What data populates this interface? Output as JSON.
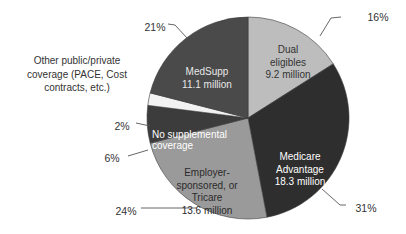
{
  "chart_data": {
    "type": "pie",
    "title": "",
    "start": "top",
    "direction": "clockwise",
    "slices": [
      {
        "key": "dual",
        "label_lines": [
          "Dual",
          "eligibles",
          "9.2 million"
        ],
        "value_millions": 9.2,
        "percent": 16,
        "percent_label": "16%",
        "color": "#bdbdbd",
        "text_color": "#333333"
      },
      {
        "key": "ma",
        "label_lines": [
          "Medicare",
          "Advantage",
          "18.3 million"
        ],
        "value_millions": 18.3,
        "percent": 31,
        "percent_label": "31%",
        "color": "#2e2e2e",
        "text_color": "#ffffff"
      },
      {
        "key": "employer",
        "label_lines": [
          "Employer-",
          "sponsored, or",
          "Tricare",
          "13.6 million"
        ],
        "value_millions": 13.6,
        "percent": 24,
        "percent_label": "24%",
        "color": "#9a9a9a",
        "text_color": "#2a2a2a"
      },
      {
        "key": "nosupp",
        "label_lines": [
          "No supplemental",
          "coverage"
        ],
        "value_millions": null,
        "percent": 6,
        "percent_label": "6%",
        "color": "#3c3c3c",
        "text_color": "#ffffff"
      },
      {
        "key": "other",
        "label_lines": [
          "Other public/private",
          "coverage (PACE, Cost",
          "contracts, etc.)"
        ],
        "value_millions": null,
        "percent": 2,
        "percent_label": "2%",
        "color": "#f2f2f2",
        "text_color": "#333333"
      },
      {
        "key": "medsupp",
        "label_lines": [
          "MedSupp",
          "11.1 million"
        ],
        "value_millions": 11.1,
        "percent": 21,
        "percent_label": "21%",
        "color": "#4a4a4a",
        "text_color": "#e8e8e8"
      }
    ]
  }
}
